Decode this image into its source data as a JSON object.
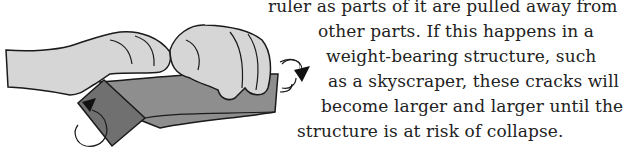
{
  "illustration": {
    "description": "Two hands twisting a ruler with rotation arrows",
    "colors": {
      "skin": "#d4d4d4",
      "ruler_top": "#8a8a8a",
      "ruler_side": "#6e6e6e",
      "outline": "#1a1a1a"
    }
  },
  "text": {
    "lines": [
      "ruler as parts of it are pulled away from",
      "other parts. If this happens in a",
      "weight-bearing structure, such",
      "as a skyscraper, these cracks will",
      "become larger and larger until the",
      "structure is at risk of collapse."
    ]
  }
}
